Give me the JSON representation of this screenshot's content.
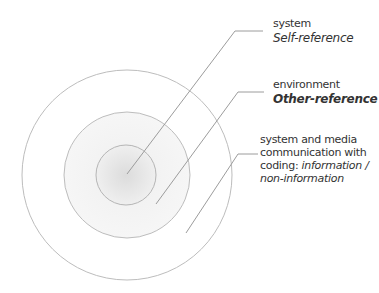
{
  "diagram": {
    "type": "concentric-circles",
    "colors": {
      "stroke": "#b9b9b9",
      "leader": "#9a9a9a",
      "text": "#333333",
      "inner_fill_center": "#dedede",
      "inner_fill_edge": "#f0f0f0",
      "middle_fill": "#f4f4f4",
      "outer_fill": "#ffffff"
    },
    "circles": [
      {
        "id": "outer",
        "cx": 127,
        "cy": 175,
        "r": 105
      },
      {
        "id": "middle",
        "cx": 127,
        "cy": 175,
        "r": 63
      },
      {
        "id": "inner",
        "cx": 126,
        "cy": 175,
        "r": 30
      }
    ],
    "labels": [
      {
        "id": "system",
        "title": "system",
        "subtitle": "Self-reference",
        "subtitle_style": "italic"
      },
      {
        "id": "environment",
        "title": "environment",
        "subtitle": "Other-reference",
        "subtitle_style": "bold-italic"
      },
      {
        "id": "media",
        "lines": [
          "system and media",
          "communication with"
        ],
        "line3_prefix": "coding: ",
        "line3_italic": "information /",
        "line4_italic": "non-information"
      }
    ]
  }
}
